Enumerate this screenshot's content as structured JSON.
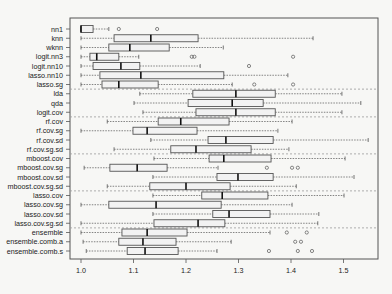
{
  "chart_data": {
    "type": "boxplot",
    "orientation": "horizontal",
    "title": "",
    "xlabel": "",
    "ylabel": "",
    "xlim": [
      0.98,
      1.56
    ],
    "xticks": [
      1.0,
      1.1,
      1.2,
      1.3,
      1.4,
      1.5
    ],
    "xtick_labels": [
      "1.0",
      "1.1",
      "1.2",
      "1.3",
      "1.4",
      "1.5"
    ],
    "grid": false,
    "legend": null,
    "group_separators_after": [
      "lasso.sg",
      "logit.cov",
      "rf.cov.sg.sd",
      "mboost.cov.sg.sd",
      "lasso.cov.sg.sd"
    ],
    "series": [
      {
        "name": "nn1",
        "whisker_low": 1.0,
        "q1": 1.0,
        "median": 1.0,
        "q3": 1.023,
        "whisker_high": 1.053,
        "outliers": [
          1.072,
          1.145
        ]
      },
      {
        "name": "knn",
        "whisker_low": 1.0,
        "q1": 1.063,
        "median": 1.133,
        "q3": 1.223,
        "whisker_high": 1.442,
        "outliers": []
      },
      {
        "name": "wknn",
        "whisker_low": 1.0,
        "q1": 1.053,
        "median": 1.093,
        "q3": 1.168,
        "whisker_high": 1.271,
        "outliers": []
      },
      {
        "name": "logit.nn3",
        "whisker_low": 1.0,
        "q1": 1.017,
        "median": 1.03,
        "q3": 1.072,
        "whisker_high": 1.11,
        "outliers": [
          1.211,
          1.216,
          1.404
        ]
      },
      {
        "name": "logit.nn10",
        "whisker_low": 1.0,
        "q1": 1.023,
        "median": 1.076,
        "q3": 1.112,
        "whisker_high": 1.227,
        "outliers": [
          1.32
        ]
      },
      {
        "name": "lasso.nn10",
        "whisker_low": 1.0,
        "q1": 1.036,
        "median": 1.114,
        "q3": 1.272,
        "whisker_high": 1.394,
        "outliers": []
      },
      {
        "name": "lasso.sg",
        "whisker_low": 1.0,
        "q1": 1.04,
        "median": 1.072,
        "q3": 1.147,
        "whisker_high": 1.288,
        "outliers": [
          1.33,
          1.404
        ]
      },
      {
        "name": "lda",
        "whisker_low": 1.112,
        "q1": 1.213,
        "median": 1.295,
        "q3": 1.37,
        "whisker_high": 1.497,
        "outliers": []
      },
      {
        "name": "qda",
        "whisker_low": 1.101,
        "q1": 1.204,
        "median": 1.288,
        "q3": 1.347,
        "whisker_high": 1.533,
        "outliers": []
      },
      {
        "name": "logit.cov",
        "whisker_low": 1.118,
        "q1": 1.219,
        "median": 1.295,
        "q3": 1.37,
        "whisker_high": 1.497,
        "outliers": []
      },
      {
        "name": "rf.cov",
        "whisker_low": 1.05,
        "q1": 1.147,
        "median": 1.19,
        "q3": 1.282,
        "whisker_high": 1.402,
        "outliers": []
      },
      {
        "name": "rf.cov.sg",
        "whisker_low": 1.0,
        "q1": 1.099,
        "median": 1.126,
        "q3": 1.221,
        "whisker_high": 1.375,
        "outliers": []
      },
      {
        "name": "rf.cov.sd",
        "whisker_low": 1.133,
        "q1": 1.242,
        "median": 1.276,
        "q3": 1.366,
        "whisker_high": 1.547,
        "outliers": []
      },
      {
        "name": "rf.cov.sg.sd",
        "whisker_low": 1.063,
        "q1": 1.171,
        "median": 1.219,
        "q3": 1.324,
        "whisker_high": 1.396,
        "outliers": []
      },
      {
        "name": "mboost.cov",
        "whisker_low": 1.139,
        "q1": 1.244,
        "median": 1.272,
        "q3": 1.362,
        "whisker_high": 1.503,
        "outliers": []
      },
      {
        "name": "mboost.cov.sg",
        "whisker_low": 1.006,
        "q1": 1.055,
        "median": 1.107,
        "q3": 1.164,
        "whisker_high": 1.261,
        "outliers": [
          1.354,
          1.402,
          1.413
        ]
      },
      {
        "name": "mboost.cov.sd",
        "whisker_low": 1.137,
        "q1": 1.259,
        "median": 1.299,
        "q3": 1.366,
        "whisker_high": 1.52,
        "outliers": []
      },
      {
        "name": "mboost.cov.sg.sd",
        "whisker_low": 1.05,
        "q1": 1.131,
        "median": 1.2,
        "q3": 1.284,
        "whisker_high": 1.41,
        "outliers": []
      },
      {
        "name": "lasso.cov",
        "whisker_low": 1.137,
        "q1": 1.23,
        "median": 1.269,
        "q3": 1.356,
        "whisker_high": 1.501,
        "outliers": []
      },
      {
        "name": "lasso.cov.sg",
        "whisker_low": 1.0,
        "q1": 1.053,
        "median": 1.143,
        "q3": 1.267,
        "whisker_high": 1.402,
        "outliers": []
      },
      {
        "name": "lasso.cov.sd",
        "whisker_low": 1.137,
        "q1": 1.251,
        "median": 1.282,
        "q3": 1.36,
        "whisker_high": 1.453,
        "outliers": []
      },
      {
        "name": "lasso.cov.sg.sd",
        "whisker_low": 1.0,
        "q1": 1.139,
        "median": 1.223,
        "q3": 1.274,
        "whisker_high": 1.451,
        "outliers": []
      },
      {
        "name": "ensemble",
        "whisker_low": 1.0,
        "q1": 1.078,
        "median": 1.126,
        "q3": 1.202,
        "whisker_high": 1.36,
        "outliers": [
          1.392,
          1.43
        ]
      },
      {
        "name": "ensemble.comb.a",
        "whisker_low": 1.004,
        "q1": 1.072,
        "median": 1.118,
        "q3": 1.181,
        "whisker_high": 1.286,
        "outliers": [
          1.408,
          1.419
        ]
      },
      {
        "name": "ensemble.comb.s",
        "whisker_low": 1.01,
        "q1": 1.088,
        "median": 1.122,
        "q3": 1.185,
        "whisker_high": 1.259,
        "outliers": [
          1.358,
          1.413,
          1.44
        ]
      }
    ]
  },
  "style": {
    "background": "#f7f7f5",
    "frame_color": "#555555",
    "box_fill": "#f2f2f2",
    "box_stroke": "#555555",
    "median_color": "#111111",
    "whisker_color": "#666666",
    "separator_color": "#999999",
    "text_color": "#222222"
  }
}
